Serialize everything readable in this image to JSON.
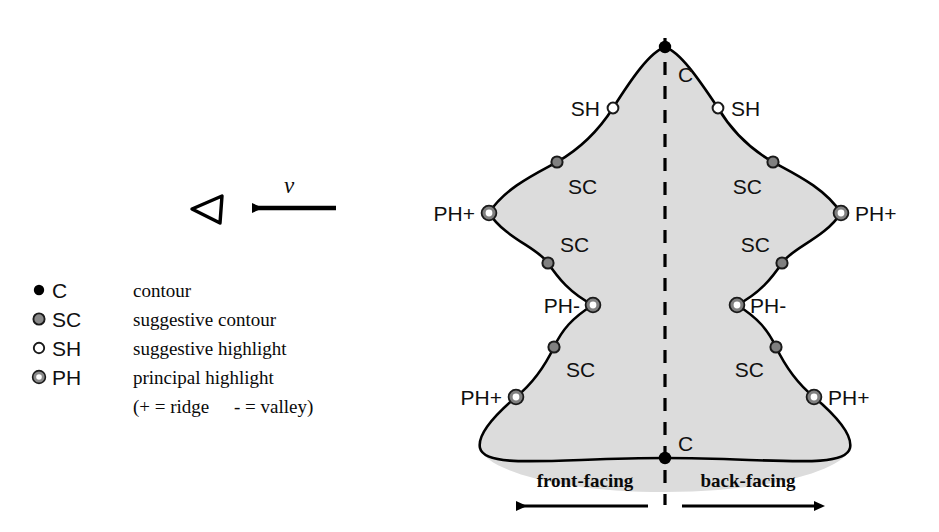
{
  "figure": {
    "colors": {
      "surface_fill": "#dcdcdc",
      "outline": "#000000",
      "contour_marker": "#000000",
      "suggestive_contour_marker": "#808080",
      "suggestive_highlight_marker": "#ffffff",
      "principal_highlight_ring": "#808080",
      "principal_highlight_core": "#ffffff",
      "text": "#0a0a0a"
    }
  },
  "viewer": {
    "eye_icon": "view-triangle-icon",
    "velocity_label": "v",
    "arrow_icon": "left-arrow-icon"
  },
  "legend": {
    "rows": [
      {
        "marker": "contour-dot",
        "code": "C",
        "description": "contour"
      },
      {
        "marker": "suggestive-contour-dot",
        "code": "SC",
        "description": "suggestive contour"
      },
      {
        "marker": "suggestive-highlight-dot",
        "code": "SH",
        "description": "suggestive highlight"
      },
      {
        "marker": "principal-highlight-dot",
        "code": "PH",
        "description": "principal highlight"
      }
    ],
    "note": "(+ = ridge    - = valley)",
    "note_parts": {
      "plus": "(+ = ridge",
      "minus": "- = valley)"
    }
  },
  "diagram": {
    "symmetry_axis": "dashed-center-line",
    "side_labels": {
      "left": "front-facing",
      "right": "back-facing"
    },
    "markers": [
      {
        "id": "c-top",
        "type": "C",
        "label": "C",
        "x": 665,
        "y": 47,
        "label_x": 678,
        "label_y": 82,
        "anchor": "start"
      },
      {
        "id": "sh-left",
        "type": "SH",
        "label": "SH",
        "x": 613,
        "y": 108,
        "label_x": 600,
        "label_y": 116,
        "anchor": "end"
      },
      {
        "id": "sh-right",
        "type": "SH",
        "label": "SH",
        "x": 718,
        "y": 108,
        "label_x": 731,
        "label_y": 116,
        "anchor": "start"
      },
      {
        "id": "sc-ul",
        "type": "SC",
        "label": "SC",
        "x": 557,
        "y": 162,
        "label_x": 568,
        "label_y": 194,
        "anchor": "start"
      },
      {
        "id": "sc-ur",
        "type": "SC",
        "label": "SC",
        "x": 773,
        "y": 162,
        "label_x": 762,
        "label_y": 194,
        "anchor": "end"
      },
      {
        "id": "phplus-ul",
        "type": "PH",
        "label": "PH+",
        "x": 489,
        "y": 213,
        "label_x": 475,
        "label_y": 221,
        "anchor": "end"
      },
      {
        "id": "phplus-ur",
        "type": "PH",
        "label": "PH+",
        "x": 841,
        "y": 213,
        "label_x": 855,
        "label_y": 221,
        "anchor": "start"
      },
      {
        "id": "sc-ml",
        "type": "SC",
        "label": "SC",
        "x": 548,
        "y": 263,
        "label_x": 560,
        "label_y": 252,
        "anchor": "start"
      },
      {
        "id": "sc-mr",
        "type": "SC",
        "label": "SC",
        "x": 782,
        "y": 263,
        "label_x": 770,
        "label_y": 252,
        "anchor": "end"
      },
      {
        "id": "phminus-l",
        "type": "PH",
        "label": "PH-",
        "x": 593,
        "y": 305,
        "label_x": 580,
        "label_y": 313,
        "anchor": "end"
      },
      {
        "id": "phminus-r",
        "type": "PH",
        "label": "PH-",
        "x": 737,
        "y": 305,
        "label_x": 750,
        "label_y": 313,
        "anchor": "start"
      },
      {
        "id": "sc-ll",
        "type": "SC",
        "label": "SC",
        "x": 554,
        "y": 347,
        "label_x": 566,
        "label_y": 377,
        "anchor": "start"
      },
      {
        "id": "sc-lr",
        "type": "SC",
        "label": "SC",
        "x": 776,
        "y": 347,
        "label_x": 764,
        "label_y": 377,
        "anchor": "end"
      },
      {
        "id": "phplus-ll",
        "type": "PH",
        "label": "PH+",
        "x": 516,
        "y": 397,
        "label_x": 502,
        "label_y": 405,
        "anchor": "end"
      },
      {
        "id": "phplus-lr",
        "type": "PH",
        "label": "PH+",
        "x": 814,
        "y": 397,
        "label_x": 828,
        "label_y": 405,
        "anchor": "start"
      },
      {
        "id": "c-bottom",
        "type": "C",
        "label": "C",
        "x": 665,
        "y": 458,
        "label_x": 678,
        "label_y": 451,
        "anchor": "start"
      }
    ]
  }
}
